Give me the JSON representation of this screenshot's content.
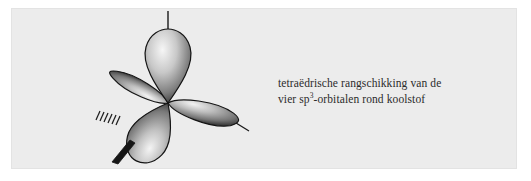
{
  "figure": {
    "kind": "chemistry-orbital-illustration",
    "panel": {
      "background_color": "#ececec",
      "border_color": "#e3e3e3"
    },
    "page_background_color": "#ffffff"
  },
  "caption": {
    "line1": "tetraëdrische rangschikking van de",
    "line2_before_sup": "vier sp",
    "line2_sup": "3",
    "line2_after_sup": "-orbitalen rond koolstof",
    "full_text": "tetraëdrische rangschikking van de vier sp3-orbitalen rond koolstof",
    "text_color": "#2b2b2b"
  },
  "diagram": {
    "center_label": "carbon-nucleus",
    "center_x": 168,
    "center_y": 103,
    "lobe_fill_light": "#f2f2f2",
    "lobe_fill_mid": "#9a9a9a",
    "lobe_fill_dark": "#1d1d1d",
    "lobe_outline": "#141414",
    "bond_color": "#1a1a1a",
    "lobes": [
      {
        "name": "lobe-top",
        "direction": "up",
        "length": 74,
        "width": 52
      },
      {
        "name": "lobe-left-back",
        "direction": "left-upper",
        "length": 62,
        "width": 40
      },
      {
        "name": "lobe-right-back",
        "direction": "right-lower",
        "length": 70,
        "width": 44
      },
      {
        "name": "lobe-front-bottom",
        "direction": "down-left",
        "length": 58,
        "width": 42
      }
    ],
    "bonds": [
      {
        "name": "bond-top",
        "style": "plain-line",
        "angle_deg": 90,
        "length": 22
      },
      {
        "name": "bond-right",
        "style": "plain-line",
        "angle_deg": -30,
        "length": 20
      },
      {
        "name": "bond-front",
        "style": "bold-wedge",
        "angle_deg": 245,
        "length": 26
      },
      {
        "name": "bond-back-hashed",
        "style": "hashed",
        "angle_deg": 170,
        "length": 22,
        "hash_count": 6
      }
    ]
  }
}
